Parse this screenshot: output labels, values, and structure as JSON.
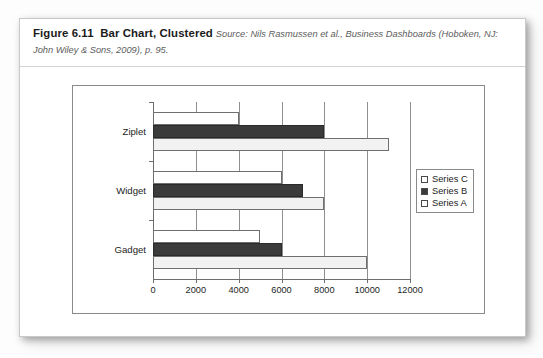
{
  "figure": {
    "label": "Figure 6.11",
    "title": "Bar Chart, Clustered",
    "source_line_1": "Source: Nils Rasmussen et al., Business Dashboards (Hoboken, NJ:",
    "source_line_2": "John Wiley & Sons, 2009), p. 95."
  },
  "colors": {
    "series_a": "#f2f2f2",
    "series_b": "#3b3b3b",
    "series_c": "#ffffff",
    "axis": "#6e6e6e",
    "gridline": "#8f8f8f",
    "frame": "#8a8a8a"
  },
  "chart_data": {
    "type": "bar",
    "orientation": "horizontal",
    "title": "",
    "xlabel": "",
    "ylabel": "",
    "categories": [
      "Ziplet",
      "Widget",
      "Gadget"
    ],
    "series": [
      {
        "name": "Series C",
        "values": [
          4000,
          6000,
          5000
        ]
      },
      {
        "name": "Series B",
        "values": [
          8000,
          7000,
          6000
        ]
      },
      {
        "name": "Series A",
        "values": [
          11000,
          8000,
          10000
        ]
      }
    ],
    "xlim": [
      0,
      12000
    ],
    "xticks": [
      0,
      2000,
      4000,
      6000,
      8000,
      10000,
      12000
    ],
    "xtick_labels": [
      "0",
      "2000",
      "4000",
      "6000",
      "8000",
      "10000",
      "12000"
    ],
    "grid": true,
    "legend_position": "right",
    "legend_order": [
      "Series C",
      "Series B",
      "Series A"
    ]
  }
}
